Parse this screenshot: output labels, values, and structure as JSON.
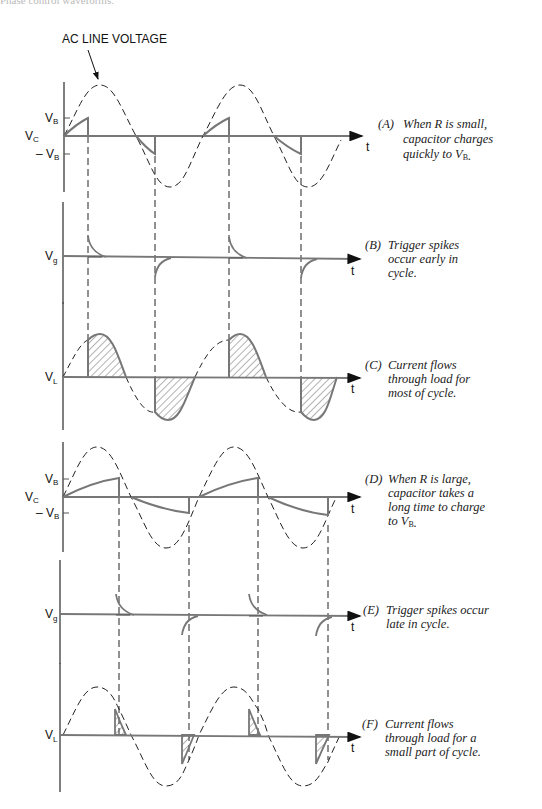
{
  "header": {
    "clipped_caption": "Phase control waveforms."
  },
  "annotation": {
    "ac_line_voltage": "AC LINE VOLTAGE"
  },
  "axes": {
    "t": "t",
    "VC": "V",
    "VC_sub": "C",
    "VB": "V",
    "VB_sub": "B",
    "negVB": "– V",
    "Vg": "V",
    "Vg_sub": "g",
    "VL": "V",
    "VL_sub": "L"
  },
  "panels": [
    {
      "id": "A",
      "label": "(A)",
      "lines": [
        "When R is small,",
        "capacitor charges",
        "quickly to V"
      ],
      "sub": "B",
      "tail": "."
    },
    {
      "id": "B",
      "label": "(B)",
      "lines": [
        "Trigger spikes",
        "occur early in",
        "cycle."
      ]
    },
    {
      "id": "C",
      "label": "(C)",
      "lines": [
        "Current flows",
        "through load for",
        "most of cycle."
      ]
    },
    {
      "id": "D",
      "label": "(D)",
      "lines": [
        "When R is large,",
        "capacitor takes a",
        "long time to charge",
        "to V"
      ],
      "sub": "B",
      "tail": "."
    },
    {
      "id": "E",
      "label": "(E)",
      "lines": [
        "Trigger spikes occur",
        "late in cycle."
      ]
    },
    {
      "id": "F",
      "label": "(F)",
      "lines": [
        "Current flows",
        "through load for a",
        "small part of cycle."
      ]
    }
  ],
  "colors": {
    "waveform": "#7a7a7a",
    "dashed": "#222222",
    "hatch": "#555555",
    "text": "#111111"
  }
}
